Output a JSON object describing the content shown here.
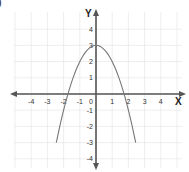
{
  "corner_label": ")",
  "chart_data": {
    "type": "line",
    "title": "",
    "xlabel": "X",
    "ylabel": "Y",
    "xlim": [
      -5,
      5
    ],
    "ylim": [
      -4.5,
      4.5
    ],
    "x_ticks": [
      -4,
      -3,
      -2,
      -1,
      0,
      1,
      2,
      3,
      4
    ],
    "y_ticks": [
      4,
      3,
      2,
      1,
      -1,
      -2,
      -3,
      -4
    ],
    "grid": true,
    "legend": null,
    "series": [
      {
        "name": "parabola",
        "equation": "y = 3 - x^2",
        "x": [
          -2.45,
          -2.0,
          -1.73,
          -1.5,
          -1.0,
          -0.5,
          0,
          0.5,
          1.0,
          1.5,
          1.73,
          2.0,
          2.45
        ],
        "y": [
          -3.0,
          -1.0,
          0.0,
          0.75,
          2.0,
          2.75,
          3.0,
          2.75,
          2.0,
          0.75,
          0.0,
          -1.0,
          -3.0
        ]
      }
    ],
    "colors": {
      "axis": "#555555",
      "grid": "#e6e6e6",
      "curve": "#777777"
    }
  }
}
